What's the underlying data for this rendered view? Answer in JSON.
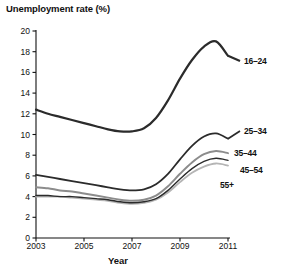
{
  "chart_data": {
    "type": "line",
    "title": "Unemployment rate (%)",
    "xlabel": "Year",
    "ylabel": "Unemployment rate (%)",
    "xlim": [
      2003,
      2011
    ],
    "ylim": [
      0,
      20
    ],
    "grid": false,
    "legend_position": "right-inline",
    "xticks": [
      "2003",
      "2005",
      "2007",
      "2009",
      "2011"
    ],
    "xtick_values": [
      2003,
      2005,
      2007,
      2009,
      2011
    ],
    "yticks": [
      "0",
      "2",
      "4",
      "6",
      "8",
      "10",
      "12",
      "14",
      "16",
      "18",
      "20"
    ],
    "ytick_values": [
      0,
      2,
      4,
      6,
      8,
      10,
      12,
      14,
      16,
      18,
      20
    ],
    "x": [
      2003,
      2003.5,
      2004,
      2004.5,
      2005,
      2005.5,
      2006,
      2006.5,
      2007,
      2007.5,
      2008,
      2008.5,
      2009,
      2009.5,
      2010,
      2010.5,
      2011
    ],
    "series": [
      {
        "name": "16-24",
        "label": "16–24",
        "color": "#2b2b2b",
        "width": 2.2,
        "values": [
          12.4,
          12.0,
          11.7,
          11.4,
          11.1,
          10.8,
          10.5,
          10.3,
          10.3,
          10.6,
          11.6,
          13.3,
          15.4,
          17.2,
          18.5,
          19.0,
          17.6
        ]
      },
      {
        "name": "25-34",
        "label": "25–34",
        "color": "#2b2b2b",
        "width": 1.8,
        "values": [
          6.1,
          5.9,
          5.7,
          5.5,
          5.3,
          5.1,
          4.9,
          4.7,
          4.6,
          4.7,
          5.2,
          6.2,
          7.6,
          8.9,
          9.8,
          10.1,
          9.6
        ]
      },
      {
        "name": "35-44",
        "label": "35–44",
        "color": "#8c8c8c",
        "width": 2.0,
        "values": [
          4.9,
          4.8,
          4.6,
          4.5,
          4.3,
          4.1,
          3.9,
          3.7,
          3.6,
          3.7,
          4.1,
          5.0,
          6.2,
          7.3,
          8.1,
          8.4,
          8.2
        ]
      },
      {
        "name": "45-54",
        "label": "45–54",
        "color": "#2b2b2b",
        "width": 1.4,
        "values": [
          4.1,
          4.1,
          4.0,
          4.0,
          3.9,
          3.8,
          3.7,
          3.5,
          3.4,
          3.5,
          3.8,
          4.6,
          5.7,
          6.7,
          7.4,
          7.7,
          7.5
        ]
      },
      {
        "name": "55+",
        "label": "55+",
        "color": "#b5b5b5",
        "width": 1.8,
        "values": [
          4.0,
          4.0,
          4.0,
          3.9,
          3.8,
          3.7,
          3.6,
          3.4,
          3.3,
          3.4,
          3.7,
          4.4,
          5.4,
          6.3,
          6.9,
          7.2,
          7.0
        ]
      }
    ],
    "series_labels": [
      {
        "text": "16–24",
        "x": 244,
        "y": 61
      },
      {
        "text": "25–34",
        "x": 244,
        "y": 131
      },
      {
        "text": "35–44",
        "x": 234,
        "y": 153
      },
      {
        "text": "45–54",
        "x": 240,
        "y": 170
      },
      {
        "text": "55+",
        "x": 220,
        "y": 185
      }
    ],
    "axis_color": "#111111",
    "background": "#ffffff"
  },
  "plot_geometry": {
    "left": 36,
    "right": 228,
    "top": 31,
    "bottom": 238
  }
}
